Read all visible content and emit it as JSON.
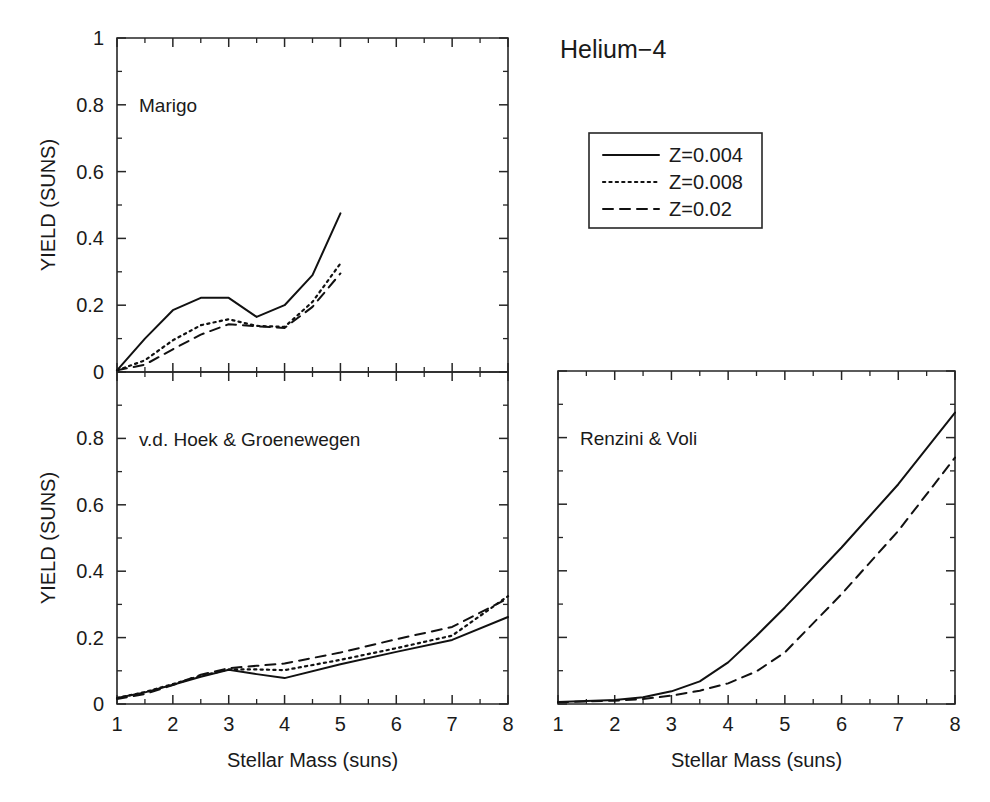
{
  "figure": {
    "title": "Helium−4",
    "background_color": "#ffffff",
    "line_color": "#111111",
    "axis_color": "#262626"
  },
  "legend": {
    "position": "top-right",
    "entries": [
      {
        "label": "Z=0.004",
        "style": "solid"
      },
      {
        "label": "Z=0.008",
        "style": "dotted"
      },
      {
        "label": "Z=0.02",
        "style": "dashed"
      }
    ]
  },
  "axes": {
    "x_label": "Stellar Mass (suns)",
    "y_label": "YIELD (SUNS)",
    "x_ticks": [
      "1",
      "2",
      "3",
      "4",
      "5",
      "6",
      "7",
      "8"
    ],
    "y_ticks": [
      "0",
      "0.2",
      "0.4",
      "0.6",
      "0.8",
      "1"
    ],
    "x_range": [
      1,
      8
    ],
    "y_range": [
      0,
      1
    ]
  },
  "chart_data": [
    {
      "type": "line",
      "title": "Marigo",
      "panel": "top-left",
      "xlabel": "",
      "ylabel": "YIELD (SUNS)",
      "xlim": [
        1,
        8
      ],
      "ylim": [
        0,
        1
      ],
      "grid": false,
      "legend_position": "external-top-right",
      "x": [
        1.0,
        1.5,
        2.0,
        2.5,
        3.0,
        3.5,
        4.0,
        4.5,
        5.0
      ],
      "series": [
        {
          "name": "Z=0.004",
          "style": "solid",
          "x": [
            1.0,
            1.5,
            2.0,
            2.5,
            3.0,
            3.5,
            4.0,
            4.5,
            5.0
          ],
          "values": [
            0.005,
            0.1,
            0.185,
            0.222,
            0.222,
            0.165,
            0.2,
            0.29,
            0.475
          ]
        },
        {
          "name": "Z=0.008",
          "style": "dotted",
          "x": [
            1.0,
            1.5,
            2.0,
            2.5,
            3.0,
            3.5,
            4.0,
            4.5,
            5.0
          ],
          "values": [
            0.005,
            0.035,
            0.095,
            0.14,
            0.158,
            0.138,
            0.135,
            0.21,
            0.325
          ]
        },
        {
          "name": "Z=0.02",
          "style": "dashed",
          "x": [
            1.0,
            1.5,
            2.0,
            2.5,
            3.0,
            3.5,
            4.0,
            4.5,
            5.0
          ],
          "values": [
            0.005,
            0.022,
            0.068,
            0.112,
            0.143,
            0.137,
            0.132,
            0.195,
            0.295
          ]
        }
      ]
    },
    {
      "type": "line",
      "title": "v.d. Hoek & Groenewegen",
      "panel": "bottom-left",
      "xlabel": "Stellar Mass (suns)",
      "ylabel": "YIELD (SUNS)",
      "xlim": [
        1,
        8
      ],
      "ylim": [
        0,
        1
      ],
      "grid": false,
      "legend_position": "external-top-right",
      "x": [
        1.0,
        1.5,
        2.0,
        2.5,
        3.0,
        3.5,
        4.0,
        5.0,
        6.0,
        7.0,
        8.0
      ],
      "series": [
        {
          "name": "Z=0.004",
          "style": "solid",
          "x": [
            1.0,
            1.5,
            2.0,
            2.5,
            3.0,
            3.5,
            4.0,
            5.0,
            6.0,
            7.0,
            8.0
          ],
          "values": [
            0.018,
            0.035,
            0.058,
            0.082,
            0.103,
            0.09,
            0.078,
            0.12,
            0.157,
            0.193,
            0.262
          ]
        },
        {
          "name": "Z=0.008",
          "style": "dotted",
          "x": [
            1.0,
            1.5,
            2.0,
            2.5,
            3.0,
            3.5,
            4.0,
            5.0,
            6.0,
            7.0,
            8.0
          ],
          "values": [
            0.018,
            0.036,
            0.06,
            0.085,
            0.104,
            0.104,
            0.102,
            0.133,
            0.168,
            0.206,
            0.325
          ]
        },
        {
          "name": "Z=0.02",
          "style": "dashed",
          "x": [
            1.0,
            1.5,
            2.0,
            2.5,
            3.0,
            3.5,
            4.0,
            5.0,
            6.0,
            7.0,
            8.0
          ],
          "values": [
            0.015,
            0.03,
            0.057,
            0.088,
            0.108,
            0.115,
            0.122,
            0.155,
            0.195,
            0.232,
            0.318
          ]
        }
      ]
    },
    {
      "type": "line",
      "title": "Renzini & Voli",
      "panel": "bottom-right",
      "xlabel": "Stellar Mass (suns)",
      "ylabel": "",
      "xlim": [
        1,
        8
      ],
      "ylim": [
        0,
        1
      ],
      "grid": false,
      "legend_position": "external-top-right",
      "x": [
        1.0,
        2.0,
        2.5,
        3.0,
        3.5,
        4.0,
        4.5,
        5.0,
        6.0,
        7.0,
        8.0
      ],
      "series": [
        {
          "name": "Z=0.004",
          "style": "solid",
          "x": [
            1.0,
            2.0,
            2.5,
            3.0,
            3.5,
            4.0,
            4.5,
            5.0,
            6.0,
            7.0,
            8.0
          ],
          "values": [
            0.006,
            0.012,
            0.02,
            0.038,
            0.068,
            0.125,
            0.205,
            0.29,
            0.47,
            0.66,
            0.875
          ]
        },
        {
          "name": "Z=0.02",
          "style": "dashed",
          "x": [
            1.0,
            2.0,
            2.5,
            3.0,
            3.5,
            4.0,
            4.5,
            5.0,
            6.0,
            7.0,
            8.0
          ],
          "values": [
            0.005,
            0.01,
            0.015,
            0.025,
            0.04,
            0.062,
            0.098,
            0.155,
            0.33,
            0.52,
            0.74
          ]
        }
      ]
    }
  ]
}
